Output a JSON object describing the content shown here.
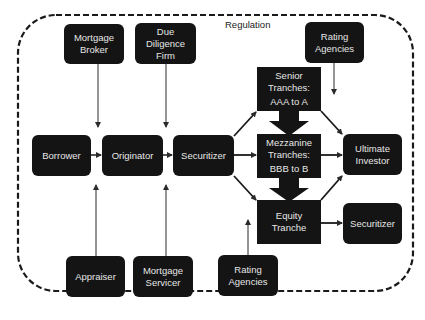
{
  "region": {
    "label": "Regulation"
  },
  "nodes": {
    "mortgage_broker": {
      "lines": [
        "Mortgage",
        "Broker"
      ]
    },
    "due_diligence": {
      "lines": [
        "Due",
        "Diligence",
        "Firm"
      ]
    },
    "rating_top": {
      "lines": [
        "Rating",
        "Agencies"
      ]
    },
    "borrower": {
      "lines": [
        "Borrower"
      ]
    },
    "originator": {
      "lines": [
        "Originator"
      ]
    },
    "securitizer": {
      "lines": [
        "Securitizer"
      ]
    },
    "senior": {
      "lines": [
        "Senior",
        "Tranches:",
        "AAA to A"
      ]
    },
    "mezzanine": {
      "lines": [
        "Mezzanine",
        "Tranches:",
        "BBB to B"
      ]
    },
    "equity": {
      "lines": [
        "Equity",
        "Tranche"
      ]
    },
    "ultimate_investor": {
      "lines": [
        "Ultimate",
        "Investor"
      ]
    },
    "securitizer_right": {
      "lines": [
        "Securitizer"
      ]
    },
    "appraiser": {
      "lines": [
        "Appraiser"
      ]
    },
    "mortgage_servicer": {
      "lines": [
        "Mortgage",
        "Servicer"
      ]
    },
    "rating_bottom": {
      "lines": [
        "Rating",
        "Agencies"
      ]
    }
  },
  "edges": [
    {
      "from": "mortgage_broker",
      "to": "originator"
    },
    {
      "from": "due_diligence",
      "to": "securitizer"
    },
    {
      "from": "rating_top",
      "to": "ultimate_investor_region"
    },
    {
      "from": "borrower",
      "to": "originator"
    },
    {
      "from": "originator",
      "to": "securitizer"
    },
    {
      "from": "securitizer",
      "to": "senior"
    },
    {
      "from": "securitizer",
      "to": "mezzanine"
    },
    {
      "from": "securitizer",
      "to": "equity"
    },
    {
      "from": "senior",
      "to": "ultimate_investor"
    },
    {
      "from": "mezzanine",
      "to": "ultimate_investor"
    },
    {
      "from": "equity",
      "to": "ultimate_investor"
    },
    {
      "from": "equity",
      "to": "securitizer_right"
    },
    {
      "from": "senior",
      "to": "mezzanine",
      "style": "block"
    },
    {
      "from": "mezzanine",
      "to": "equity",
      "style": "block"
    },
    {
      "from": "appraiser",
      "to": "originator"
    },
    {
      "from": "mortgage_servicer",
      "to": "securitizer"
    },
    {
      "from": "rating_bottom",
      "to": "equity"
    }
  ]
}
